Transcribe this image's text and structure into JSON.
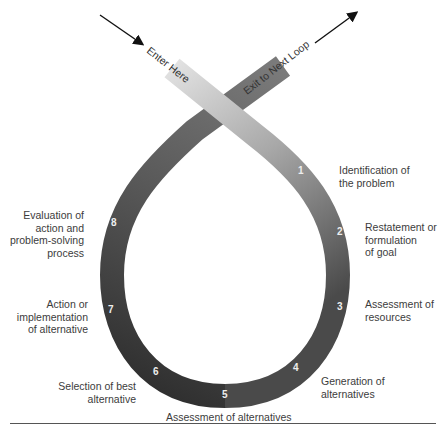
{
  "entry": {
    "label": "Enter Here"
  },
  "exit": {
    "label": "Exit to Next Loop"
  },
  "steps": [
    {
      "number": "1",
      "label": "Identification of\nthe problem"
    },
    {
      "number": "2",
      "label": "Restatement or\nformulation\nof goal"
    },
    {
      "number": "3",
      "label": "Assessment of\nresources"
    },
    {
      "number": "4",
      "label": "Generation of\nalternatives"
    },
    {
      "number": "5",
      "label": "Assessment of alternatives"
    },
    {
      "number": "6",
      "label": "Selection of best\nalternative"
    },
    {
      "number": "7",
      "label": "Action or\nimplementation\nof alternative"
    },
    {
      "number": "8",
      "label": "Evaluation of\naction and\nproblem-solving\nprocess"
    }
  ],
  "colors": {
    "band_light": "#dcdcdc",
    "band_mid": "#8a8a8a",
    "band_dark": "#3a3a3a",
    "arrow": "#111111"
  }
}
